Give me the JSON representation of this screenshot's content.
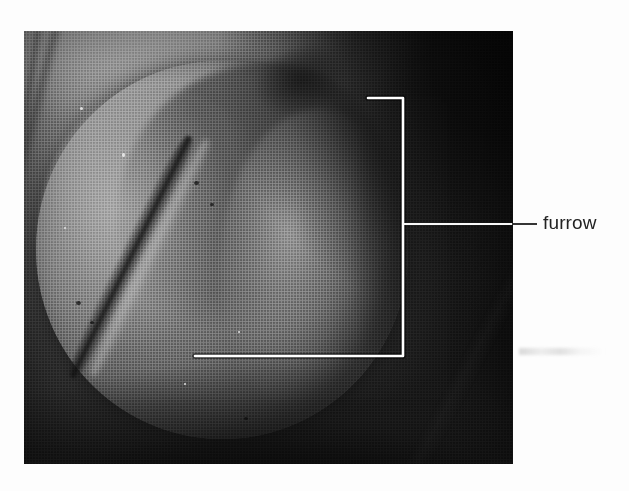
{
  "figure": {
    "kind": "micrograph-figure",
    "caption_labels": [
      {
        "id": "furrow",
        "text": "furrow",
        "leader": "horizontal-line-to-bracket",
        "points_to": "cleavage-furrow-bracket"
      }
    ],
    "annotation": {
      "bracket_color": "#ffffff",
      "bracket_shape": "开-shaped rectangular bracket with rounded corners",
      "leader_color": "#2b2b2b"
    },
    "photo": {
      "alt": "Grayscale halftone micrograph of a dividing egg cell showing a diagonal cleavage furrow",
      "tone": "grayscale",
      "background_color": "#141414",
      "body_color": "#989898",
      "furrow_color": "#141414"
    },
    "page_background": "#fdfdfd",
    "label_text_color": "#232323"
  }
}
